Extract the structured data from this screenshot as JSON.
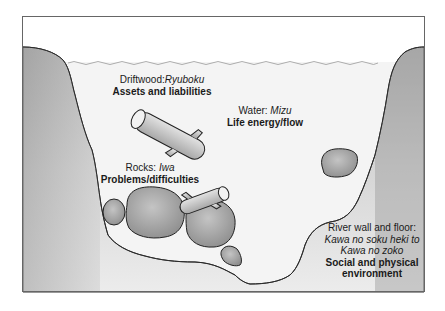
{
  "diagram": {
    "colors": {
      "frame": "#555555",
      "water": "#f4f4f4",
      "river_wall": "#b5b5b5",
      "rock": "#a8a8a8",
      "outline": "#222222",
      "surface_line": "#999999"
    },
    "labels": {
      "driftwood": {
        "term": "Driftwood:",
        "japanese": "Ryuboku",
        "meaning": "Assets and liabilities"
      },
      "water": {
        "term": "Water:",
        "japanese": "Mizu",
        "meaning": "Life energy/flow"
      },
      "rocks": {
        "term": "Rocks:",
        "japanese": "Iwa",
        "meaning": "Problems/difficulties"
      },
      "river_wall": {
        "term": "River wall and floor:",
        "japanese_line1": "Kawa no soku heki to",
        "japanese_line2": "Kawa no zoko",
        "meaning_line1": "Social and physical",
        "meaning_line2": "environment"
      }
    }
  }
}
